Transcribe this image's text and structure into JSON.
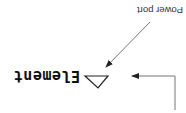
{
  "diagram": {
    "orientation": "rotated-180",
    "labels": {
      "power_port": "Power port",
      "element": "Element"
    },
    "symbol": "triangle",
    "colors": {
      "background": "#ffffff",
      "line": "#777777",
      "text": "#111111"
    }
  }
}
